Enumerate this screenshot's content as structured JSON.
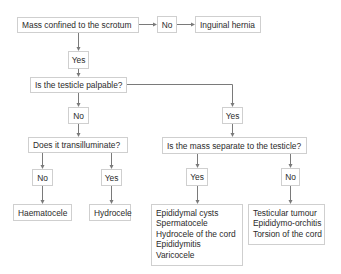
{
  "diagram": {
    "type": "flowchart",
    "colors": {
      "box_border": "#cfcfcf",
      "text": "#2b2b2b",
      "arrow": "#7a7a7a",
      "background": "#ffffff"
    },
    "nodes": {
      "q1": {
        "label": "Mass confined to the scrotum"
      },
      "q1_no": {
        "label": "No"
      },
      "inguinal": {
        "label": "Inguinal hernia"
      },
      "q1_yes": {
        "label": "Yes"
      },
      "q2": {
        "label": "Is the testicle palpable?"
      },
      "q2_no": {
        "label": "No"
      },
      "q2_yes": {
        "label": "Yes"
      },
      "q3": {
        "label": "Does it transilluminate?"
      },
      "q3_no": {
        "label": "No"
      },
      "q3_yes": {
        "label": "Yes"
      },
      "haematocele": {
        "label": "Haematocele"
      },
      "hydrocele": {
        "label": "Hydrocele"
      },
      "q4": {
        "label": "Is the mass separate to the testicle?"
      },
      "q4_yes": {
        "label": "Yes"
      },
      "q4_no": {
        "label": "No"
      },
      "separate_list": {
        "items": [
          "Epididymal cysts",
          "Spermatocele",
          "Hydrocele of the cord",
          "Epididymitis",
          "Varicocele"
        ]
      },
      "not_separate_list": {
        "items": [
          "Testicular tumour",
          "Epididymo-orchitis",
          "Torsion of the cord"
        ]
      }
    },
    "edges": [
      [
        "q1",
        "q1_no"
      ],
      [
        "q1_no",
        "inguinal"
      ],
      [
        "q1",
        "q1_yes"
      ],
      [
        "q1_yes",
        "q2"
      ],
      [
        "q2",
        "q2_no"
      ],
      [
        "q2",
        "q2_yes"
      ],
      [
        "q2_no",
        "q3"
      ],
      [
        "q2_yes",
        "q4"
      ],
      [
        "q3",
        "q3_no"
      ],
      [
        "q3",
        "q3_yes"
      ],
      [
        "q3_no",
        "haematocele"
      ],
      [
        "q3_yes",
        "hydrocele"
      ],
      [
        "q4",
        "q4_yes"
      ],
      [
        "q4",
        "q4_no"
      ],
      [
        "q4_yes",
        "separate_list"
      ],
      [
        "q4_no",
        "not_separate_list"
      ]
    ]
  }
}
